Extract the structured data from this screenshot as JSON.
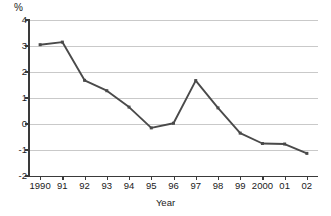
{
  "chart_data": {
    "type": "line",
    "title": "",
    "xlabel": "Year",
    "ylabel": "%",
    "categories": [
      "1990",
      "91",
      "92",
      "93",
      "94",
      "95",
      "96",
      "97",
      "98",
      "99",
      "2000",
      "01",
      "02"
    ],
    "values": [
      3.05,
      3.15,
      1.68,
      1.28,
      0.65,
      -0.15,
      0.03,
      1.67,
      0.62,
      -0.35,
      -0.75,
      -0.77,
      -1.13
    ],
    "series": [
      {
        "name": "rate",
        "values": [
          3.05,
          3.15,
          1.68,
          1.28,
          0.65,
          -0.15,
          0.03,
          1.67,
          0.62,
          -0.35,
          -0.75,
          -0.77,
          -1.13
        ]
      }
    ],
    "ylim": [
      -2,
      4
    ],
    "y_ticks": [
      4,
      3,
      2,
      1,
      0,
      -1,
      -2
    ],
    "y_tick_labels": [
      "4",
      "3",
      "2",
      "1",
      "0",
      "-1",
      "-2"
    ],
    "grid": true,
    "legend": false,
    "line_color": "#4a4a4a",
    "grid_color": "#c9c9c9",
    "axis_color": "#3a3a3a"
  },
  "axes": {
    "y_unit_label": "%",
    "x_title": "Year"
  }
}
